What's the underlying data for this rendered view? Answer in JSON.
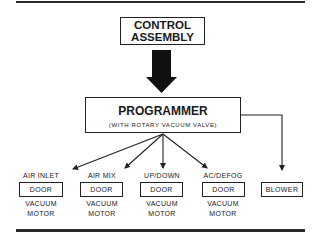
{
  "diagram": {
    "control": {
      "line1": "CONTROL",
      "line2": "ASSEMBLY"
    },
    "programmer": {
      "title": "PROGRAMMER",
      "subtitle": "(WITH ROTARY VACUUM VALVE)"
    },
    "outputs": [
      {
        "label": "AIR INLET",
        "box": "DOOR",
        "below1": "VACUUM",
        "below2": "MOTOR"
      },
      {
        "label": "AIR MIX",
        "box": "DOOR",
        "below1": "VACUUM",
        "below2": "MOTOR"
      },
      {
        "label": "UP/DOWN",
        "box": "DOOR",
        "below1": "VACUUM",
        "below2": "MOTOR"
      },
      {
        "label": "AC/DEFOG",
        "box": "DOOR",
        "below1": "VACUUM",
        "below2": "MOTOR"
      },
      {
        "label": "",
        "box": "BLOWER",
        "below1": "",
        "below2": ""
      }
    ]
  }
}
